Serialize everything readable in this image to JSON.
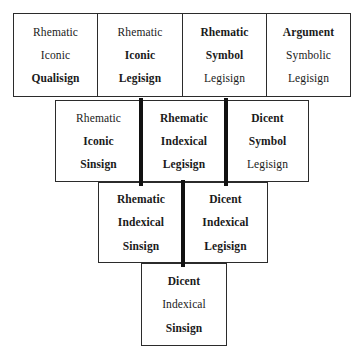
{
  "diagram": {
    "colors": {
      "background": "#ffffff",
      "border": "#2b2b2b",
      "thick_divider": "#111111",
      "text": "#1a1a1a"
    },
    "rows": [
      {
        "row_index": 1,
        "cells": [
          {
            "id": "cell-1",
            "terms": [
              {
                "text": "Rhematic",
                "bold": false
              },
              {
                "text": "Iconic",
                "bold": false
              },
              {
                "text": "Qualisign",
                "bold": true
              }
            ]
          },
          {
            "id": "cell-2",
            "terms": [
              {
                "text": "Rhematic",
                "bold": false
              },
              {
                "text": "Iconic",
                "bold": true
              },
              {
                "text": "Legisign",
                "bold": true
              }
            ]
          },
          {
            "id": "cell-3",
            "terms": [
              {
                "text": "Rhematic",
                "bold": true
              },
              {
                "text": "Symbol",
                "bold": true
              },
              {
                "text": "Legisign",
                "bold": false
              }
            ]
          },
          {
            "id": "cell-4",
            "terms": [
              {
                "text": "Argument",
                "bold": true
              },
              {
                "text": "Symbolic",
                "bold": false
              },
              {
                "text": "Legisign",
                "bold": false
              }
            ]
          }
        ]
      },
      {
        "row_index": 2,
        "cells": [
          {
            "id": "cell-5",
            "terms": [
              {
                "text": "Rhematic",
                "bold": false
              },
              {
                "text": "Iconic",
                "bold": true
              },
              {
                "text": "Sinsign",
                "bold": true
              }
            ]
          },
          {
            "id": "cell-6",
            "terms": [
              {
                "text": "Rhematic",
                "bold": true
              },
              {
                "text": "Indexical",
                "bold": true
              },
              {
                "text": "Legisign",
                "bold": true
              }
            ]
          },
          {
            "id": "cell-7",
            "terms": [
              {
                "text": "Dicent",
                "bold": true
              },
              {
                "text": "Symbol",
                "bold": true
              },
              {
                "text": "Legisign",
                "bold": false
              }
            ]
          }
        ]
      },
      {
        "row_index": 3,
        "cells": [
          {
            "id": "cell-8",
            "terms": [
              {
                "text": "Rhematic",
                "bold": true
              },
              {
                "text": "Indexical",
                "bold": true
              },
              {
                "text": "Sinsign",
                "bold": true
              }
            ]
          },
          {
            "id": "cell-9",
            "terms": [
              {
                "text": "Dicent",
                "bold": true
              },
              {
                "text": "Indexical",
                "bold": true
              },
              {
                "text": "Legisign",
                "bold": true
              }
            ]
          }
        ]
      },
      {
        "row_index": 4,
        "cells": [
          {
            "id": "cell-10",
            "terms": [
              {
                "text": "Dicent",
                "bold": true
              },
              {
                "text": "Indexical",
                "bold": false
              },
              {
                "text": "Sinsign",
                "bold": true
              }
            ]
          }
        ]
      }
    ]
  }
}
